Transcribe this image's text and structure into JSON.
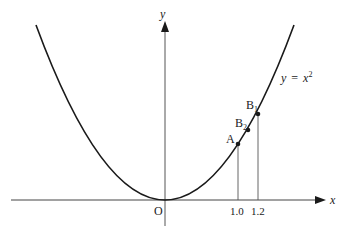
{
  "diagram": {
    "type": "parabola-graph",
    "curve_label": {
      "lhs": "y",
      "eq": "=",
      "rhs_base": "x",
      "rhs_exp": "2"
    },
    "axes": {
      "x_label": "x",
      "y_label": "y",
      "origin_label": "O"
    },
    "x_ticks": [
      {
        "label": "1.0",
        "value": 1.0
      },
      {
        "label": "1.2",
        "value": 1.2
      }
    ],
    "points": [
      {
        "name": "A",
        "label": "A",
        "sub": ""
      },
      {
        "name": "B2",
        "label": "B",
        "sub": "2"
      },
      {
        "name": "B1",
        "label": "B",
        "sub": "1"
      }
    ],
    "colors": {
      "line": "#1a1a1a",
      "axis": "#333333",
      "guide": "#555555"
    }
  }
}
